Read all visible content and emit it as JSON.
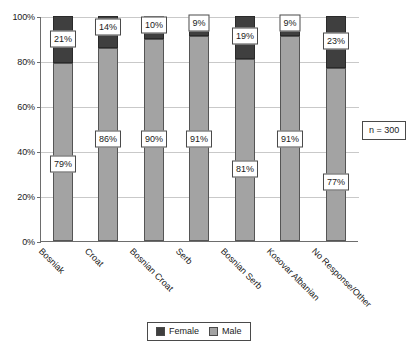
{
  "chart_data": {
    "type": "bar",
    "variant": "stacked-100-percent",
    "title": "",
    "subtitle": "",
    "xlabel": "",
    "ylabel": "",
    "ylim": [
      0,
      100
    ],
    "ytick_labels": [
      "0%",
      "20%",
      "40%",
      "60%",
      "80%",
      "100%"
    ],
    "ytick_values": [
      0,
      20,
      40,
      60,
      80,
      100
    ],
    "grid": true,
    "legend_position": "bottom",
    "categories": [
      "Bosniak",
      "Croat",
      "Bosnian Croat",
      "Serb",
      "Bosnian Serb",
      "Kosovar Albanian",
      "No Response/Other"
    ],
    "series": [
      {
        "name": "Female",
        "color": "#3f3f3f",
        "values": [
          21,
          14,
          10,
          9,
          19,
          9,
          23
        ],
        "labels": [
          "21%",
          "14%",
          "10%",
          "9%",
          "19%",
          "9%",
          "23%"
        ]
      },
      {
        "name": "Male",
        "color": "#a3a3a3",
        "values": [
          79,
          86,
          90,
          91,
          81,
          91,
          77
        ],
        "labels": [
          "79%",
          "86%",
          "90%",
          "91%",
          "81%",
          "91%",
          "77%"
        ]
      }
    ],
    "annotations": [
      {
        "name": "sample-size",
        "text": "n = 300"
      }
    ]
  },
  "legend": {
    "items": [
      {
        "label": "Female",
        "swatch": "legend-swatch-female"
      },
      {
        "label": "Male",
        "swatch": "legend-swatch-male"
      }
    ]
  }
}
